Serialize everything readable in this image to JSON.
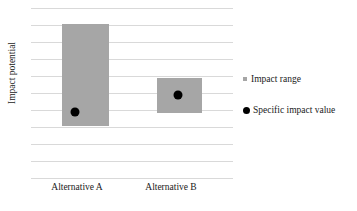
{
  "chart_data": {
    "type": "bar",
    "title": "",
    "subtitle": "",
    "xlabel": "",
    "ylabel": "Impact potential",
    "categories": [
      "Alternative A",
      "Alternative B"
    ],
    "grid": true,
    "grid_lines": 11,
    "legend_position": "right",
    "axis_tick_labels": [],
    "ylim": [
      0,
      10
    ],
    "series": [
      {
        "name": "Impact range",
        "type": "range-bar",
        "color": "#a6a6a6",
        "values": [
          {
            "category": "Alternative A",
            "low": 3.0,
            "high": 9.0
          },
          {
            "category": "Alternative B",
            "low": 3.8,
            "high": 5.8
          }
        ]
      },
      {
        "name": "Specific impact value",
        "type": "point",
        "color": "#000000",
        "values": [
          {
            "category": "Alternative A",
            "value": 3.85
          },
          {
            "category": "Alternative B",
            "value": 4.85
          }
        ]
      }
    ],
    "legend": [
      {
        "label": "Impact range",
        "marker": "square",
        "color": "#a6a6a6"
      },
      {
        "label": "Specific impact value",
        "marker": "circle",
        "color": "#000000"
      }
    ]
  },
  "axes": {
    "y_axis_title": "Impact potential",
    "x_tick_labels": [
      "Alternative A",
      "Alternative B"
    ]
  },
  "legend": {
    "items": [
      {
        "label": "Impact range",
        "marker": "impact-range-swatch"
      },
      {
        "label": "Specific impact value",
        "marker": "specific-impact-value-marker"
      }
    ]
  },
  "colors": {
    "bar_fill": "#a6a6a6",
    "dot_fill": "#000000",
    "gridline": "#d9d9d9",
    "text": "#1a1a1a",
    "background": "#ffffff"
  },
  "geometry": {
    "gridline_y": [
      0,
      17,
      34,
      51,
      68,
      85,
      102,
      119,
      136,
      153,
      170
    ],
    "bars": [
      {
        "name": "Alternative A",
        "left": 31,
        "width": 47,
        "top": 16,
        "height": 102
      },
      {
        "name": "Alternative B",
        "left": 126,
        "width": 45,
        "top": 70,
        "height": 35
      }
    ],
    "dots": [
      {
        "name": "Alternative A",
        "cx": 44,
        "cy": 104
      },
      {
        "name": "Alternative B",
        "cx": 147,
        "cy": 87
      }
    ],
    "xticks": [
      {
        "left": 29,
        "width": 96
      },
      {
        "left": 123,
        "width": 96
      }
    ]
  }
}
